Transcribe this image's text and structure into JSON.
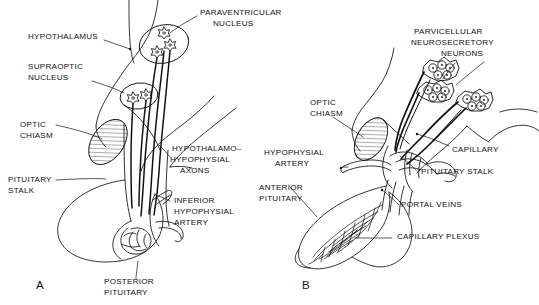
{
  "figure": {
    "ink_color": "#111111",
    "background_color": "#ffffff",
    "panels": [
      {
        "letter": "A",
        "name": "posterior-pituitary-magnocellular-system",
        "labels": [
          {
            "id": "hypothalamus",
            "text": "HYPOTHALAMUS"
          },
          {
            "id": "supraoptic-nucleus",
            "text": "SUPRAOPTIC\nNUCLEUS"
          },
          {
            "id": "optic-chiasm",
            "text": "OPTIC\nCHIASM"
          },
          {
            "id": "pituitary-stalk",
            "text": "PITUITARY\nSTALK"
          },
          {
            "id": "paraventricular-nucleus",
            "text": "PARAVENTRICULAR\nNUCLEUS"
          },
          {
            "id": "hypothalamo-hypophysial-axons",
            "text": "HYPOTHALAMO–\nHYPOPHYSIAL\nAXONS"
          },
          {
            "id": "inferior-hypophysial-artery",
            "text": "INFERIOR\nHYPOPHYSIAL\nARTERY"
          },
          {
            "id": "posterior-pituitary",
            "text": "POSTERIOR\nPITUITARY"
          }
        ]
      },
      {
        "letter": "B",
        "name": "anterior-pituitary-portal-system",
        "labels": [
          {
            "id": "parvicellular-neurosecretory-neurons",
            "text": "PARVICELLULAR\nNEUROSECRETORY\nNEURONS"
          },
          {
            "id": "optic-chiasm-b",
            "text": "OPTIC\nCHIASM"
          },
          {
            "id": "hypophysial-artery",
            "text": "HYPOPHYSIAL\nARTERY"
          },
          {
            "id": "anterior-pituitary",
            "text": "ANTERIOR\nPITUITARY"
          },
          {
            "id": "capillary",
            "text": "CAPILLARY"
          },
          {
            "id": "pituitary-stalk-b",
            "text": "PITUITARY STALK"
          },
          {
            "id": "portal-veins",
            "text": "PORTAL VEINS"
          },
          {
            "id": "capillary-plexus",
            "text": "CAPILLARY PLEXUS"
          }
        ]
      }
    ]
  },
  "panelA": {
    "letter": "A",
    "hypothalamus": "HYPOTHALAMUS",
    "supraoptic_line1": "SUPRAOPTIC",
    "supraoptic_line2": "NUCLEUS",
    "optic_line1": "OPTIC",
    "optic_line2": "CHIASM",
    "stalk_line1": "PITUITARY",
    "stalk_line2": "STALK",
    "paraventricular_line1": "PARAVENTRICULAR",
    "paraventricular_line2": "NUCLEUS",
    "axons_line1": "HYPOTHALAMO–",
    "axons_line2": "HYPOPHYSIAL",
    "axons_line3": "AXONS",
    "iha_line1": "INFERIOR",
    "iha_line2": "HYPOPHYSIAL",
    "iha_line3": "ARTERY",
    "posterior_line1": "POSTERIOR",
    "posterior_line2": "PITUITARY"
  },
  "panelB": {
    "letter": "B",
    "parvicellular_line1": "PARVICELLULAR",
    "parvicellular_line2": "NEUROSECRETORY",
    "parvicellular_line3": "NEURONS",
    "optic_line1": "OPTIC",
    "optic_line2": "CHIASM",
    "artery_line1": "HYPOPHYSIAL",
    "artery_line2": "ARTERY",
    "anterior_line1": "ANTERIOR",
    "anterior_line2": "PITUITARY",
    "capillary": "CAPILLARY",
    "stalk": "PITUITARY STALK",
    "portal_veins": "PORTAL VEINS",
    "capillary_plexus": "CAPILLARY PLEXUS"
  }
}
